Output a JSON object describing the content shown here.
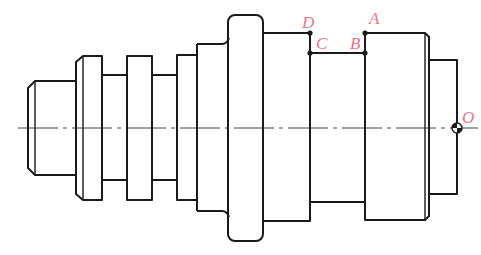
{
  "diagram": {
    "type": "shaft-drawing",
    "colors": {
      "line": "#1a1a1a",
      "label": "#e8758a",
      "centerline": "#444444"
    },
    "points": [
      {
        "id": "A",
        "label": "A",
        "x": 365,
        "y": 33
      },
      {
        "id": "B",
        "label": "B",
        "x": 365,
        "y": 53
      },
      {
        "id": "C",
        "label": "C",
        "x": 310,
        "y": 53
      },
      {
        "id": "D",
        "label": "D",
        "x": 310,
        "y": 33
      },
      {
        "id": "O",
        "label": "O",
        "x": 457,
        "y": 128
      }
    ]
  }
}
